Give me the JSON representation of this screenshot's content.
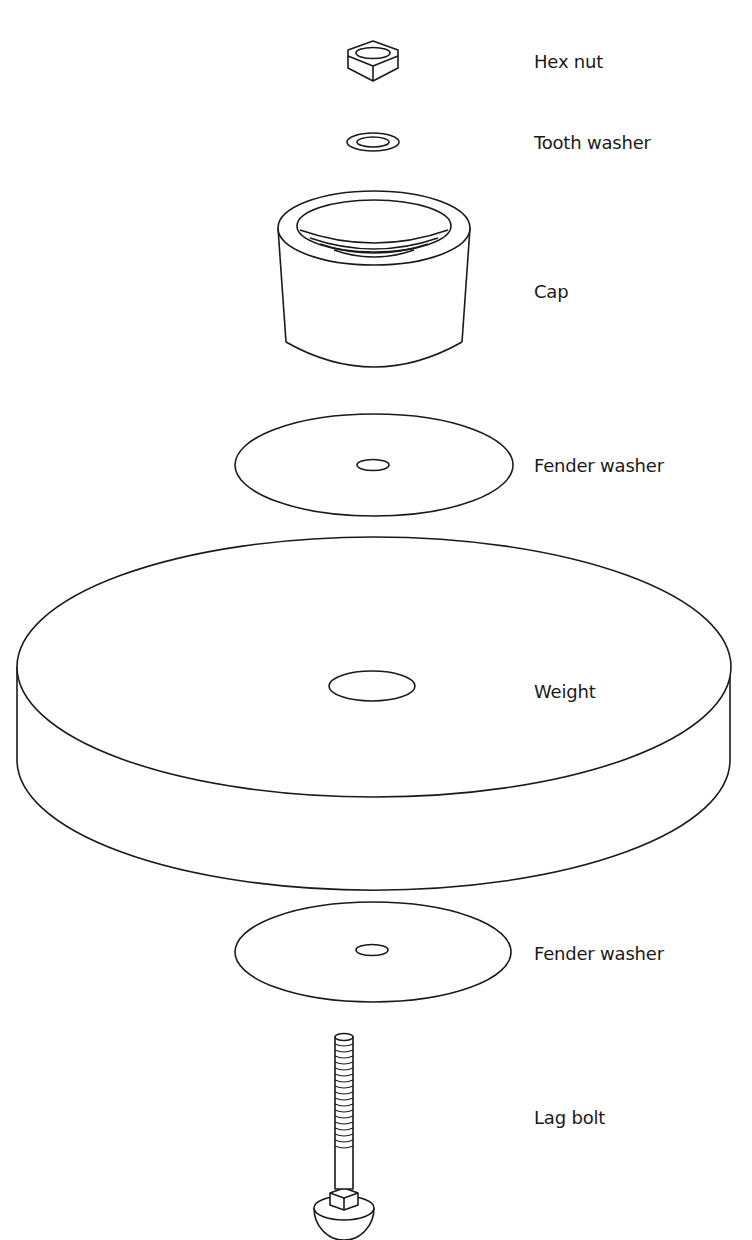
{
  "diagram": {
    "type": "exploded-assembly",
    "parts": [
      {
        "id": "hex-nut",
        "label": "Hex nut"
      },
      {
        "id": "tooth-washer",
        "label": "Tooth washer"
      },
      {
        "id": "cap",
        "label": "Cap"
      },
      {
        "id": "fender-washer-top",
        "label": "Fender washer"
      },
      {
        "id": "weight",
        "label": "Weight"
      },
      {
        "id": "fender-washer-bottom",
        "label": "Fender washer"
      },
      {
        "id": "lag-bolt",
        "label": "Lag bolt"
      }
    ],
    "colors": {
      "line": "#1a1a1a",
      "background": "#ffffff"
    }
  }
}
